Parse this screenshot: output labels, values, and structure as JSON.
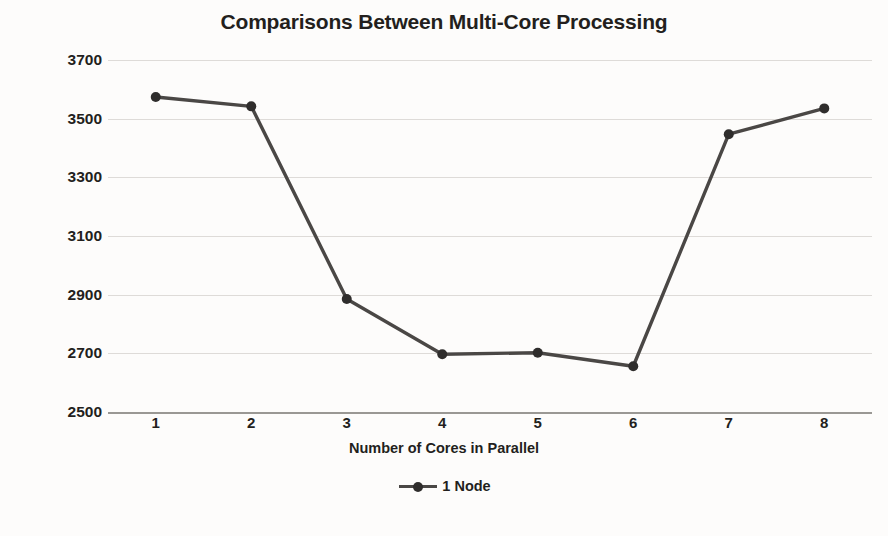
{
  "chart_data": {
    "type": "line",
    "title": "Comparisons Between Multi-Core Processing",
    "xlabel": "Number of Cores in Parallel",
    "ylabel": "Total Exec Time (s)",
    "categories": [
      "1",
      "2",
      "3",
      "4",
      "5",
      "6",
      "7",
      "8"
    ],
    "series": [
      {
        "name": "1 Node",
        "values": [
          3574,
          3542,
          2885,
          2697,
          2702,
          2656,
          3447,
          3535
        ],
        "color": "#4a4745",
        "marker": "circle",
        "marker_color": "#2f2d2c"
      }
    ],
    "ylim": [
      2500,
      3700
    ],
    "ytick_step": 200,
    "yticks": [
      "3700",
      "3500",
      "3300",
      "3100",
      "2900",
      "2700",
      "2500"
    ],
    "grid": true,
    "grid_axis": "y",
    "grid_color": "#dedbd8",
    "legend_position": "bottom-center",
    "legend_entries": [
      "1 Node"
    ],
    "background_color": "#fdfcfb",
    "text_color": "#231f1d"
  }
}
